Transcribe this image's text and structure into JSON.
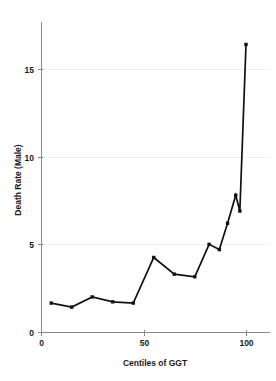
{
  "chart_data": {
    "type": "line",
    "title": "",
    "xlabel": "Centiles of GGT",
    "ylabel": "Death Rate (Male)",
    "x": [
      5,
      15,
      25,
      35,
      45,
      55,
      65,
      75,
      82,
      87,
      91,
      95,
      97,
      100
    ],
    "values": [
      1.65,
      1.42,
      2.0,
      1.72,
      1.65,
      4.25,
      3.3,
      3.15,
      5.0,
      4.7,
      6.2,
      7.8,
      6.9,
      16.4
    ],
    "series": [
      {
        "name": "Death Rate (Male)",
        "values": [
          1.65,
          1.42,
          2.0,
          1.72,
          1.65,
          4.25,
          3.3,
          3.15,
          5.0,
          4.7,
          6.2,
          7.8,
          6.9,
          16.4
        ]
      }
    ],
    "xlim": [
      0,
      112
    ],
    "ylim": [
      0,
      17.8
    ],
    "xticks": [
      0,
      50,
      100
    ],
    "xtick_labels": [
      "0",
      "50",
      "100"
    ],
    "yticks": [
      0,
      5,
      10,
      15
    ],
    "ytick_labels": [
      "0",
      "5",
      "10",
      "15"
    ],
    "grid": true,
    "grid_axis": "y",
    "legend": "none",
    "markers": true,
    "line_color": "#111111",
    "marker_color": "#111111",
    "grid_color": "#f0f0f0",
    "axis_color": "#8a8a8a",
    "background_color": "#ffffff"
  }
}
